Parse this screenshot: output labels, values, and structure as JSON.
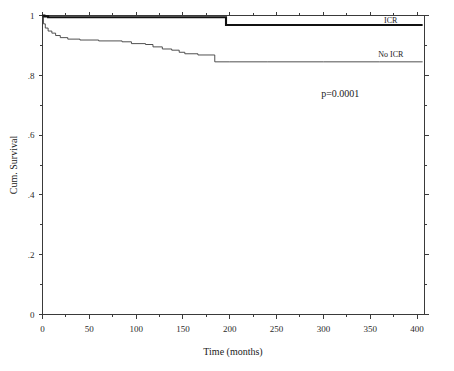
{
  "chart_data": {
    "type": "line",
    "title": "",
    "xlabel": "Time (months)",
    "ylabel": "Cum. Survival",
    "xlim": [
      0,
      408
    ],
    "ylim": [
      0,
      1
    ],
    "grid": false,
    "legend_position": "inline-right",
    "xticks": [
      0,
      50,
      100,
      150,
      200,
      250,
      300,
      350,
      400
    ],
    "xticklabels": [
      "0",
      "50",
      "100",
      "150",
      "200",
      "250",
      "300",
      "350",
      "400"
    ],
    "yticks": [
      0,
      0.2,
      0.4,
      0.6,
      0.8,
      1
    ],
    "yticklabels": [
      "0",
      ".2",
      ".4",
      ".6",
      ".8",
      "1"
    ],
    "annotations": [
      {
        "name": "p-value",
        "text": "p=0.0001",
        "x": 318,
        "y": 0.727
      }
    ],
    "series": [
      {
        "name": "ICR",
        "label": "ICR",
        "label_x": 372,
        "label_y": 0.975,
        "style": "thick-solid",
        "color": "#111111",
        "points": [
          [
            0,
            1.0
          ],
          [
            2,
            1.0
          ],
          [
            2,
            0.997
          ],
          [
            6,
            0.997
          ],
          [
            6,
            0.994
          ],
          [
            40,
            0.994
          ],
          [
            60,
            0.994
          ],
          [
            100,
            0.994
          ],
          [
            140,
            0.994
          ],
          [
            180,
            0.994
          ],
          [
            196,
            0.994
          ],
          [
            196,
            0.968
          ],
          [
            240,
            0.968
          ],
          [
            300,
            0.968
          ],
          [
            360,
            0.968
          ],
          [
            406,
            0.968
          ]
        ]
      },
      {
        "name": "No ICR",
        "label": "No ICR",
        "label_x": 372,
        "label_y": 0.862,
        "style": "thin-solid",
        "color": "#3d3d3d",
        "points": [
          [
            0,
            1.0
          ],
          [
            1,
            1.0
          ],
          [
            1,
            0.972
          ],
          [
            3,
            0.972
          ],
          [
            3,
            0.958
          ],
          [
            6,
            0.958
          ],
          [
            6,
            0.948
          ],
          [
            10,
            0.948
          ],
          [
            10,
            0.941
          ],
          [
            14,
            0.941
          ],
          [
            14,
            0.933
          ],
          [
            19,
            0.933
          ],
          [
            19,
            0.926
          ],
          [
            27,
            0.926
          ],
          [
            27,
            0.921
          ],
          [
            40,
            0.921
          ],
          [
            40,
            0.918
          ],
          [
            60,
            0.918
          ],
          [
            60,
            0.915
          ],
          [
            85,
            0.915
          ],
          [
            85,
            0.912
          ],
          [
            95,
            0.912
          ],
          [
            95,
            0.906
          ],
          [
            110,
            0.906
          ],
          [
            110,
            0.903
          ],
          [
            118,
            0.903
          ],
          [
            118,
            0.895
          ],
          [
            128,
            0.895
          ],
          [
            128,
            0.888
          ],
          [
            138,
            0.888
          ],
          [
            138,
            0.884
          ],
          [
            146,
            0.884
          ],
          [
            146,
            0.877
          ],
          [
            152,
            0.877
          ],
          [
            152,
            0.872
          ],
          [
            166,
            0.872
          ],
          [
            166,
            0.868
          ],
          [
            184,
            0.868
          ],
          [
            184,
            0.845
          ],
          [
            200,
            0.845
          ],
          [
            240,
            0.845
          ],
          [
            300,
            0.845
          ],
          [
            360,
            0.845
          ],
          [
            406,
            0.845
          ]
        ]
      }
    ]
  },
  "axes": {
    "y_title": "Cum. Survival",
    "x_title": "Time (months)",
    "x_tick_labels": [
      "0",
      "50",
      "100",
      "150",
      "200",
      "250",
      "300",
      "350",
      "400"
    ],
    "y_tick_labels": [
      "1",
      ".8",
      ".6",
      ".4",
      ".2",
      "0"
    ]
  },
  "labels": {
    "icr": "ICR",
    "no_icr": "No ICR",
    "pvalue": "p=0.0001"
  },
  "colors": {
    "frame": "#3a3a3a",
    "icr_curve": "#111111",
    "noicr_curve": "#3d3d3d",
    "text": "#1a1a1a",
    "background": "#ffffff"
  }
}
